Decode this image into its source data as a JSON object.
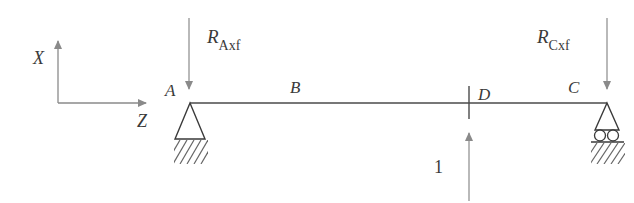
{
  "diagram": {
    "type": "simply-supported-beam",
    "colors": {
      "beam": "#4a4a4a",
      "arrow": "#8a8a8a",
      "support": "#3a3a3a",
      "hatch": "#666666",
      "text": "#3a3a3a"
    },
    "axes": {
      "x_label": "X",
      "z_label": "Z"
    },
    "points": {
      "A": "A",
      "B": "B",
      "C": "C",
      "D": "D"
    },
    "reactions": {
      "A": {
        "symbol": "R",
        "subscript": "Axf"
      },
      "C": {
        "symbol": "R",
        "subscript": "Cxf"
      }
    },
    "load": {
      "label": "1",
      "direction": "up",
      "location": "D"
    },
    "supports": {
      "A": "pin",
      "C": "roller"
    }
  }
}
